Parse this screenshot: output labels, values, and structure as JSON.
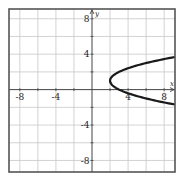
{
  "chart_data": {
    "type": "line",
    "title": "",
    "xlabel": "x",
    "ylabel": "y",
    "xlim": [
      -9.2,
      9.2
    ],
    "ylim": [
      -9.3,
      9.1
    ],
    "grid": true,
    "grid_step": 2,
    "x_ticks": [
      -8,
      -4,
      4,
      8
    ],
    "y_ticks": [
      8,
      4,
      -4,
      -8
    ],
    "x_tick_labels": [
      "-8",
      "-4",
      "4",
      "8"
    ],
    "y_tick_labels": [
      "8",
      "4",
      "-4",
      "-8"
    ],
    "series": [
      {
        "name": "x = (y - 1)^2 + 2",
        "equation": "x = (y - 1)^2 + 2",
        "vertex": [
          2,
          1
        ],
        "opens": "right",
        "points": [
          [
            9.2,
            3.68
          ],
          [
            8,
            3.45
          ],
          [
            6,
            3.0
          ],
          [
            4,
            2.41
          ],
          [
            3,
            2.0
          ],
          [
            2.25,
            1.5
          ],
          [
            2,
            1
          ],
          [
            2.25,
            0.5
          ],
          [
            3,
            0.0
          ],
          [
            4,
            -0.41
          ],
          [
            6,
            -1.0
          ],
          [
            8,
            -1.45
          ],
          [
            9.2,
            -1.68
          ]
        ]
      }
    ],
    "colors": {
      "curve": "#1a1a1a",
      "grid": "#c8c8c8",
      "axis": "#444444",
      "frame": "#555555"
    }
  }
}
